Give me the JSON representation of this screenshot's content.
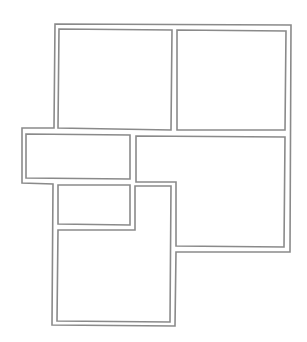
{
  "diagram": {
    "type": "floor-plan",
    "stroke_color": "#8a8a8a",
    "stroke_width": 1.6,
    "background": "#ffffff",
    "outer_wall": {
      "points": "55,24 291,25 290,252 176,252 175,326 52,325 53,184 22,183 22,128 54,128"
    },
    "rooms": [
      {
        "id": "room-top-left",
        "points": "59,29 172,30 171,130 58,128"
      },
      {
        "id": "room-top-right",
        "points": "177,30 286,31 285,130 177,130"
      },
      {
        "id": "room-middle-left",
        "points": "26,134 130,135 130,179 26,178"
      },
      {
        "id": "room-middle-right",
        "points": "136,136 285,137 284,247 176,246 176,182 136,182"
      },
      {
        "id": "room-small-closet",
        "points": "58,185 130,185 130,225 58,224"
      },
      {
        "id": "room-bottom",
        "points": "135,186 171,186 170,322 57,321 58,230 135,230"
      }
    ]
  }
}
